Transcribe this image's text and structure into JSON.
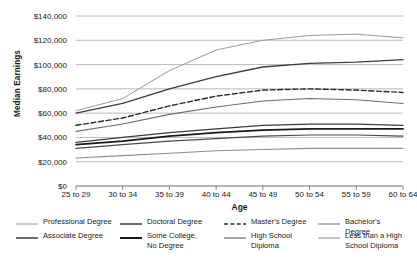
{
  "chart_data": {
    "type": "line",
    "title": "",
    "xlabel": "Age",
    "ylabel": "Median Earnings",
    "categories": [
      "25 to 29",
      "30 to 34",
      "35 to 39",
      "40 to 44",
      "45 to 49",
      "50 to 54",
      "55 to 59",
      "60 to 64"
    ],
    "ylim": [
      0,
      140000
    ],
    "ytick_values": [
      0,
      20000,
      40000,
      60000,
      80000,
      100000,
      120000,
      140000
    ],
    "ytick_labels": [
      "$0",
      "$20,000",
      "$40,000",
      "$60,000",
      "$80,000",
      "$100,000",
      "$120,000",
      "$140,000"
    ],
    "grid": true,
    "legend_position": "bottom",
    "series": [
      {
        "name": "Professional Degree",
        "color": "#9a9a9a",
        "width": 1.0,
        "dash": "none",
        "values": [
          62000,
          72000,
          95000,
          112000,
          120000,
          124000,
          125000,
          122000
        ]
      },
      {
        "name": "Doctoral Degree",
        "color": "#3c3c3c",
        "width": 1.3,
        "dash": "none",
        "values": [
          60000,
          68000,
          80000,
          90000,
          98000,
          101000,
          102000,
          104000
        ]
      },
      {
        "name": "Master's Degree",
        "color": "#2a2a2a",
        "width": 1.4,
        "dash": "dashed",
        "values": [
          50000,
          56000,
          66000,
          74000,
          79000,
          80000,
          79000,
          77000
        ]
      },
      {
        "name": "Bachelor's Degree",
        "color": "#6e6e6e",
        "width": 1.1,
        "dash": "none",
        "values": [
          45000,
          51000,
          59000,
          65000,
          70000,
          72000,
          71000,
          68000
        ]
      },
      {
        "name": "Associate Degree",
        "color": "#3c3c3c",
        "width": 1.3,
        "dash": "none",
        "values": [
          36000,
          40000,
          44000,
          47000,
          50000,
          51000,
          51000,
          50000
        ]
      },
      {
        "name": "Some College, No Degree",
        "color": "#1a1a1a",
        "width": 1.8,
        "dash": "none",
        "values": [
          34000,
          37000,
          41000,
          44000,
          46000,
          47000,
          47000,
          47000
        ]
      },
      {
        "name": "High School Diploma",
        "color": "#4a4a4a",
        "width": 1.2,
        "dash": "none",
        "values": [
          31000,
          34000,
          37000,
          39000,
          41000,
          42000,
          42000,
          41000
        ]
      },
      {
        "name": "Less than a High School Diploma",
        "color": "#8c8c8c",
        "width": 1.1,
        "dash": "none",
        "values": [
          23000,
          25000,
          27000,
          29000,
          30000,
          31000,
          31000,
          31000
        ]
      }
    ]
  },
  "legend": {
    "items": [
      {
        "label": "Professional Degree",
        "series_index": 0
      },
      {
        "label": "Doctoral Degree",
        "series_index": 1
      },
      {
        "label": "Master's Degree",
        "series_index": 2
      },
      {
        "label": "Bachelor's Degree",
        "series_index": 3
      },
      {
        "label": "Associate Degree",
        "series_index": 4
      },
      {
        "label": "Some College,\nNo Degree",
        "series_index": 5
      },
      {
        "label": "High School\nDiploma",
        "series_index": 6
      },
      {
        "label": "Less than a High\nSchool Diploma",
        "series_index": 7
      }
    ]
  },
  "style": {
    "gridline_color": "#a8a8a8",
    "axis_color": "#6b6b6b",
    "text_color": "#1a1a1a",
    "background": "#ffffff"
  }
}
